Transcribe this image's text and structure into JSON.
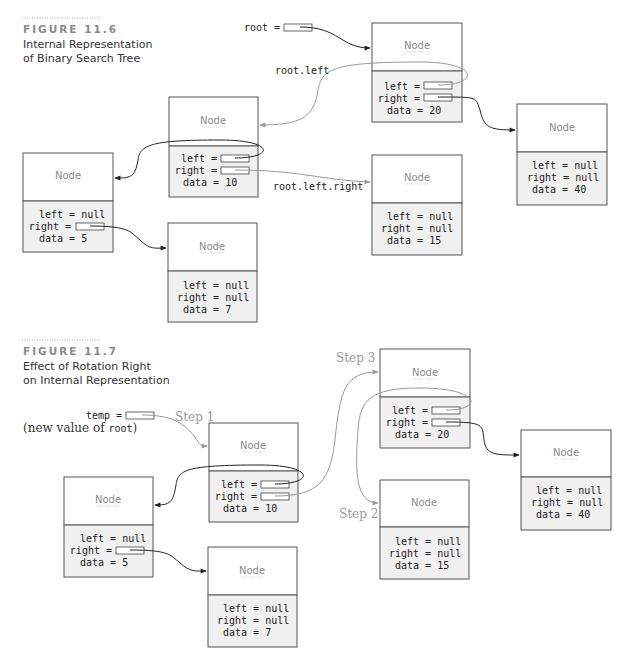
{
  "figures": [
    {
      "label": "FIGURE 11.6",
      "caption_lines": [
        "Internal Representation",
        "of Binary Search Tree"
      ],
      "variables": [
        {
          "name": "root",
          "text": "root ="
        }
      ],
      "annotations": [
        {
          "id": "root-left",
          "text": "root.left"
        },
        {
          "id": "root-left-right",
          "text": "root.left.right"
        }
      ],
      "nodes": [
        {
          "id": "n20",
          "header": "Node",
          "left": "left =",
          "right": "right =",
          "data": "data = 20",
          "left_is_ptr": true,
          "right_is_ptr": true
        },
        {
          "id": "n10",
          "header": "Node",
          "left": "left =",
          "right": "right =",
          "data": "data = 10",
          "left_is_ptr": true,
          "right_is_ptr": true
        },
        {
          "id": "n40",
          "header": "Node",
          "left": "left = null",
          "right": "right = null",
          "data": "data = 40"
        },
        {
          "id": "n5",
          "header": "Node",
          "left": "left = null",
          "right": "right =",
          "data": "data = 5",
          "right_is_ptr": true
        },
        {
          "id": "n15",
          "header": "Node",
          "left": "left = null",
          "right": "right = null",
          "data": "data = 15"
        },
        {
          "id": "n7",
          "header": "Node",
          "left": "left = null",
          "right": "right = null",
          "data": "data = 7"
        }
      ]
    },
    {
      "label": "FIGURE 11.7",
      "caption_lines": [
        "Effect of Rotation Right",
        "on Internal Representation"
      ],
      "variables": [
        {
          "name": "temp",
          "text": "temp =",
          "note_prefix": "(new value of ",
          "note_code": "root",
          "note_suffix": ")"
        }
      ],
      "steps": [
        "Step 1",
        "Step 2",
        "Step 3"
      ],
      "nodes": [
        {
          "id": "n20",
          "header": "Node",
          "left": "left =",
          "right": "right =",
          "data": "data = 20"
        },
        {
          "id": "n10",
          "header": "Node",
          "left": "left =",
          "right": "right =",
          "data": "data = 10"
        },
        {
          "id": "n40",
          "header": "Node",
          "left": "left = null",
          "right": "right = null",
          "data": "data = 40"
        },
        {
          "id": "n5",
          "header": "Node",
          "left": "left = null",
          "right": "right =",
          "data": "data = 5"
        },
        {
          "id": "n15",
          "header": "Node",
          "left": "left = null",
          "right": "right = null",
          "data": "data = 15"
        },
        {
          "id": "n7",
          "header": "Node",
          "left": "left = null",
          "right": "right = null",
          "data": "data = 7"
        }
      ]
    }
  ]
}
